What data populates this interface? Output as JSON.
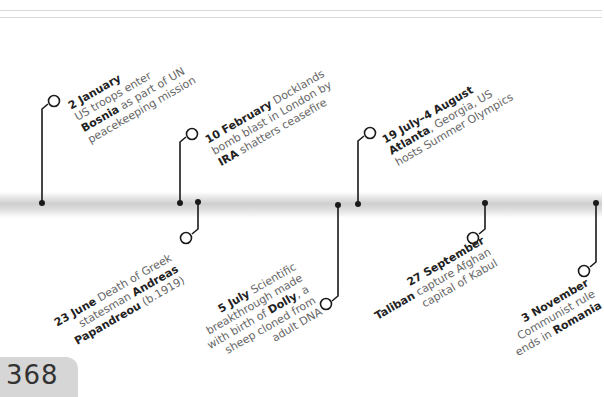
{
  "page": {
    "number": "368"
  },
  "timeline": {
    "events": [
      {
        "date": "2 January",
        "lines": [
          [
            "",
            "US troops enter"
          ],
          [
            "Bosnia",
            " as part of UN"
          ],
          [
            "",
            "peacekeeping mission"
          ]
        ],
        "position": "above"
      },
      {
        "date": "10 February",
        "lines": [
          [
            " Docklands"
          ],
          [
            "bomb blast in London by"
          ],
          [
            "IRA",
            " shatters ceasefire"
          ]
        ],
        "position": "above"
      },
      {
        "date": "23 June",
        "lines": [
          [
            "Death of Greek"
          ],
          [
            "statesman ",
            "Andreas"
          ],
          [
            "Papandreou",
            " (b.1919)"
          ]
        ],
        "position": "below"
      },
      {
        "date": "5 July",
        "lines": [
          [
            "Scientific"
          ],
          [
            "breakthrough made"
          ],
          [
            "with birth of ",
            "Dolly",
            ", a"
          ],
          [
            "sheep cloned from"
          ],
          [
            "adult DNA"
          ]
        ],
        "position": "below"
      },
      {
        "date": "19 July–4 August",
        "lines": [
          [
            "Atlanta",
            ", Georgia, US"
          ],
          [
            "hosts Summer Olympics"
          ]
        ],
        "position": "above"
      },
      {
        "date": "27 September",
        "lines": [
          [
            "Taliban",
            " capture Afghan"
          ],
          [
            "capital of Kabul"
          ]
        ],
        "position": "below"
      },
      {
        "date": "3 November",
        "lines": [
          [
            "Communist rule"
          ],
          [
            "ends in ",
            "Romania"
          ]
        ],
        "position": "below"
      }
    ],
    "text": {
      "e0_date": "2 January",
      "e0_l1": "US troops enter",
      "e0_l2b": "Bosnia",
      "e0_l2": " as part of UN",
      "e0_l3": "peacekeeping mission",
      "e1_date": "10 February",
      "e1_l1": " Docklands",
      "e1_l2": "bomb blast in London by",
      "e1_l3b": "IRA",
      "e1_l3": " shatters ceasefire",
      "e2_date": "23 June",
      "e2_l1": " Death of Greek",
      "e2_l2": "statesman ",
      "e2_l2b": "Andreas",
      "e2_l3b": "Papandreou",
      "e2_l3": " (b.1919)",
      "e3_date": "5 July",
      "e3_l1": " Scientific",
      "e3_l2": "breakthrough made",
      "e3_l3": "with birth of ",
      "e3_l3b": "Dolly",
      "e3_l3c": ", a",
      "e3_l4": "sheep cloned from",
      "e3_l5": "adult DNA",
      "e4_date": "19 July–4 August",
      "e4_l2b": "Atlanta",
      "e4_l2": ", Georgia, US",
      "e4_l3": "hosts Summer Olympics",
      "e5_date": "27 September",
      "e5_l2b": "Taliban",
      "e5_l2": " capture Afghan",
      "e5_l3": "capital of Kabul",
      "e6_date": "3 November",
      "e6_l2": "Communist rule",
      "e6_l3": "ends in ",
      "e6_l3b": "Romania"
    }
  },
  "colors": {
    "line": "#1a1a1a",
    "band": "#cfcfcf",
    "text": "#666666",
    "bold": "#222222",
    "tab": "#d6d6d6"
  }
}
